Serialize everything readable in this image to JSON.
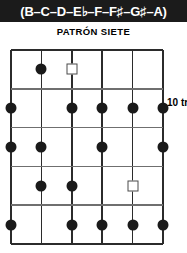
{
  "scale_header": {
    "notes_text": "(B–C–D–E♭–F–F♯–G♯–A)",
    "background_color": "#1b1b1b",
    "text_color": "#ffffff"
  },
  "pattern_title": "PATRÓN SIETE",
  "fret_position_label": "10 tr",
  "diagram": {
    "type": "guitar-fretboard-pattern",
    "strings": 6,
    "frets": 5,
    "string_color": "#2b2b2b",
    "fret_color": "#6f6f6f",
    "dot_color": "#1a1a1a",
    "root_marker_color": "#4a4a4a",
    "string_x": [
      0,
      30.4,
      60.8,
      91.2,
      121.6,
      152
    ],
    "fret_y": [
      0,
      38.8,
      77.6,
      116.4,
      155.2,
      194
    ],
    "markers": [
      {
        "fret": 1,
        "string": 2,
        "shape": "dot"
      },
      {
        "fret": 1,
        "string": 3,
        "shape": "square"
      },
      {
        "fret": 2,
        "string": 1,
        "shape": "dot"
      },
      {
        "fret": 2,
        "string": 3,
        "shape": "dot"
      },
      {
        "fret": 2,
        "string": 4,
        "shape": "dot"
      },
      {
        "fret": 2,
        "string": 5,
        "shape": "dot"
      },
      {
        "fret": 2,
        "string": 6,
        "shape": "dot"
      },
      {
        "fret": 3,
        "string": 1,
        "shape": "dot"
      },
      {
        "fret": 3,
        "string": 2,
        "shape": "dot"
      },
      {
        "fret": 3,
        "string": 4,
        "shape": "dot"
      },
      {
        "fret": 3,
        "string": 6,
        "shape": "dot"
      },
      {
        "fret": 4,
        "string": 2,
        "shape": "dot"
      },
      {
        "fret": 4,
        "string": 3,
        "shape": "dot"
      },
      {
        "fret": 4,
        "string": 5,
        "shape": "square"
      },
      {
        "fret": 5,
        "string": 1,
        "shape": "dot"
      },
      {
        "fret": 5,
        "string": 3,
        "shape": "dot"
      },
      {
        "fret": 5,
        "string": 4,
        "shape": "dot"
      },
      {
        "fret": 5,
        "string": 5,
        "shape": "dot"
      },
      {
        "fret": 5,
        "string": 6,
        "shape": "dot"
      }
    ]
  }
}
